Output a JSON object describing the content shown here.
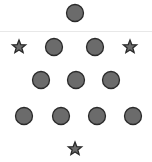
{
  "diagram": {
    "fill_color": "#6b6b6b",
    "stroke_color": "#2a2a2a",
    "divider_color": "#e8e8e8",
    "top_section": {
      "shapes": [
        {
          "type": "circle",
          "cx": 75,
          "cy": 13
        }
      ]
    },
    "bottom_section": {
      "rows": [
        {
          "shapes": [
            {
              "type": "star",
              "cx": 19,
              "cy": 47
            },
            {
              "type": "circle",
              "cx": 54,
              "cy": 47
            },
            {
              "type": "circle",
              "cx": 95,
              "cy": 47
            },
            {
              "type": "star",
              "cx": 130,
              "cy": 47
            }
          ]
        },
        {
          "shapes": [
            {
              "type": "circle",
              "cx": 41,
              "cy": 80
            },
            {
              "type": "circle",
              "cx": 76,
              "cy": 80
            },
            {
              "type": "circle",
              "cx": 111,
              "cy": 80
            }
          ]
        },
        {
          "shapes": [
            {
              "type": "circle",
              "cx": 24,
              "cy": 116
            },
            {
              "type": "circle",
              "cx": 61,
              "cy": 116
            },
            {
              "type": "circle",
              "cx": 97,
              "cy": 116
            },
            {
              "type": "circle",
              "cx": 133,
              "cy": 116
            }
          ]
        },
        {
          "shapes": [
            {
              "type": "star",
              "cx": 75,
              "cy": 149
            }
          ]
        }
      ]
    },
    "counts": {
      "circles": 10,
      "stars": 3
    }
  }
}
